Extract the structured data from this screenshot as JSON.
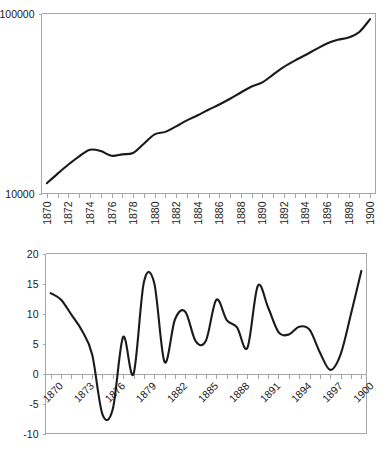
{
  "figure": {
    "background_color": "#ffffff",
    "line_color": "#1a1a1a",
    "axis_color": "#a6a6a6",
    "border_color": "#bfbfbf"
  },
  "chart_data": [
    {
      "id": "top-chart",
      "type": "line",
      "title": "",
      "subtitle": "",
      "xlabel": "",
      "ylabel": "",
      "yscale": "log",
      "ylim": [
        10000,
        100000
      ],
      "ytick_labels": [
        "100000",
        "10000"
      ],
      "ytick_values": [
        100000,
        10000
      ],
      "xlim": [
        1869.5,
        1900.5
      ],
      "xtick_labels": [
        "1870",
        "1872",
        "1874",
        "1876",
        "1878",
        "1880",
        "1882",
        "1884",
        "1886",
        "1888",
        "1890",
        "1892",
        "1894",
        "1896",
        "1898",
        "1900"
      ],
      "xtick_rotation": 90,
      "grid": false,
      "legend": null,
      "x": [
        1870,
        1871,
        1872,
        1873,
        1874,
        1875,
        1876,
        1877,
        1878,
        1879,
        1880,
        1881,
        1882,
        1883,
        1884,
        1885,
        1886,
        1887,
        1888,
        1889,
        1890,
        1891,
        1892,
        1893,
        1894,
        1895,
        1896,
        1897,
        1898,
        1899,
        1900
      ],
      "values": [
        11400,
        12900,
        14500,
        16100,
        17500,
        17200,
        16200,
        16500,
        16800,
        18900,
        21300,
        22000,
        23600,
        25500,
        27200,
        29200,
        31200,
        33600,
        36400,
        39300,
        41400,
        45800,
        50500,
        54700,
        58800,
        63400,
        68200,
        71500,
        73500,
        79000,
        93000
      ]
    },
    {
      "id": "bottom-chart",
      "type": "line",
      "title": "",
      "subtitle": "",
      "xlabel": "",
      "ylabel": "",
      "yscale": "linear",
      "ylim": [
        -10,
        20
      ],
      "ytick_labels": [
        "20",
        "15",
        "10",
        "5",
        "0",
        "-5",
        "-10"
      ],
      "ytick_values": [
        20,
        15,
        10,
        5,
        0,
        -5,
        -10
      ],
      "xlim": [
        1869.5,
        1900.5
      ],
      "xtick_labels": [
        "1870",
        "1873",
        "1876",
        "1879",
        "1882",
        "1885",
        "1888",
        "1891",
        "1894",
        "1897",
        "1900"
      ],
      "xtick_rotation": 45,
      "grid": false,
      "zero_line": 0,
      "legend": null,
      "x": [
        1870,
        1871,
        1872,
        1873,
        1874,
        1875,
        1876,
        1877,
        1878,
        1879,
        1880,
        1881,
        1882,
        1883,
        1884,
        1885,
        1886,
        1887,
        1888,
        1889,
        1890,
        1891,
        1892,
        1893,
        1894,
        1895,
        1896,
        1897,
        1898,
        1899,
        1900
      ],
      "values": [
        13.4,
        12.3,
        9.8,
        7.2,
        3.2,
        -6.8,
        -5.9,
        6.1,
        -0.1,
        15.2,
        15.1,
        1.9,
        9.0,
        10.3,
        5.4,
        5.5,
        12.3,
        8.9,
        7.7,
        4.3,
        14.6,
        11.0,
        6.9,
        6.5,
        7.8,
        7.3,
        3.5,
        0.6,
        3.2,
        9.9,
        17.1
      ]
    }
  ]
}
